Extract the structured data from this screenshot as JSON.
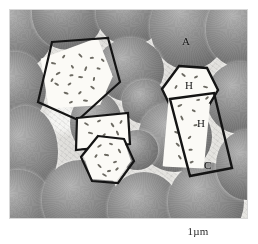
{
  "figure": {
    "kind": "electron-micrograph",
    "caption": "1µm",
    "plate": {
      "width_px": 239,
      "height_px": 210,
      "background_phase": "cement / matrix"
    },
    "labels": [
      {
        "id": "A",
        "text": "A",
        "meaning": "aggregate sphere",
        "x": 183,
        "y": 35
      },
      {
        "id": "H1",
        "text": "H",
        "meaning": "hexagonal crystal tracing",
        "x": 184,
        "y": 78
      },
      {
        "id": "H2",
        "text": "H",
        "meaning": "elongated crystal tracing",
        "x": 198,
        "y": 117
      },
      {
        "id": "C",
        "text": "C",
        "meaning": "cement matrix",
        "x": 204,
        "y": 160
      }
    ],
    "tracings": [
      {
        "name": "tracing-upper-left",
        "shape": "quadrilateral",
        "speckles": 26
      },
      {
        "name": "tracing-mid-quad",
        "shape": "quadrilateral",
        "speckles": 12
      },
      {
        "name": "tracing-mid-hexagon",
        "shape": "hexagon",
        "speckles": 16
      },
      {
        "name": "tracing-right-hexagon",
        "shape": "hexagon",
        "speckles": 14
      },
      {
        "name": "tracing-right-bar",
        "shape": "elongated-quadrilateral",
        "speckles": 18
      }
    ],
    "colors": {
      "sphere_light": "#b4b4b4",
      "sphere_dark": "#636363",
      "matrix": "#e6e5e1",
      "tracing_fill": "#fbfaf6",
      "tracing_stroke": "#151515",
      "label_text": "#141414",
      "page_background": "#ffffff"
    }
  }
}
